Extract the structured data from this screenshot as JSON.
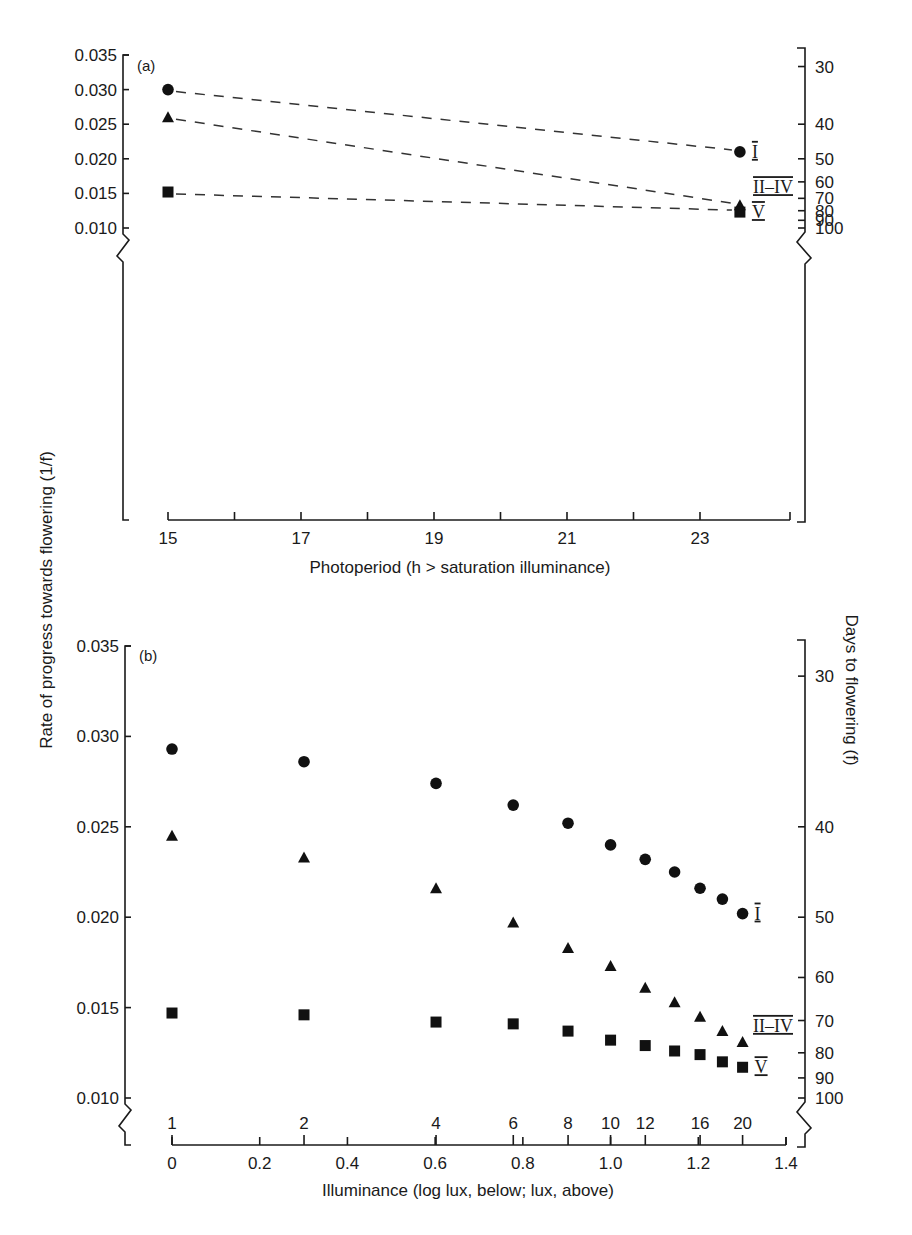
{
  "figure": {
    "shared_ylabel_left": "Rate of progress towards flowering (1/f)",
    "shared_ylabel_right": "Days to flowering (f)"
  },
  "chart_data": [
    {
      "panel": "(a)",
      "type": "line",
      "line_style": "dashed",
      "xlabel": "Photoperiod (h > saturation illuminance)",
      "ylabel": "Rate of progress towards flowering (1/f)",
      "ylabel_right": "Days to flowering (f)",
      "xlim": [
        15,
        23.8
      ],
      "ylim": [
        0.008,
        0.035
      ],
      "x_ticks": [
        15,
        16,
        17,
        18,
        19,
        20,
        21,
        22,
        23
      ],
      "x_tick_labels": [
        "15",
        "17",
        "19",
        "21",
        "23"
      ],
      "x_tick_label_values": [
        15,
        17,
        19,
        21,
        23
      ],
      "y_ticks": [
        0.01,
        0.015,
        0.02,
        0.025,
        0.03,
        0.035
      ],
      "y_tick_labels": [
        "0.010",
        "0.015",
        "0.020",
        "0.025",
        "0.030",
        "0.035"
      ],
      "right_axis_ticks_days": [
        30,
        40,
        50,
        60,
        70,
        80,
        90,
        100
      ],
      "right_axis_tick_labels": [
        "30",
        "40",
        "50",
        "60",
        "70",
        "80",
        "90",
        "100"
      ],
      "axis_break": true,
      "grid": false,
      "series": [
        {
          "name": "I",
          "marker": "circle",
          "x": [
            15,
            23.6
          ],
          "y": [
            0.03,
            0.021
          ]
        },
        {
          "name": "II–IV",
          "marker": "triangle",
          "x": [
            15,
            23.6
          ],
          "y": [
            0.026,
            0.0133
          ]
        },
        {
          "name": "V",
          "marker": "square",
          "x": [
            15,
            23.6
          ],
          "y": [
            0.0152,
            0.0123
          ]
        }
      ]
    },
    {
      "panel": "(b)",
      "type": "scatter",
      "xlabel": "Illuminance (log lux, below; lux, above)",
      "ylabel": "Rate of progress towards flowering (1/f)",
      "ylabel_right": "Days to flowering (f)",
      "xlim": [
        0,
        1.4
      ],
      "ylim": [
        0.008,
        0.035
      ],
      "x_ticks": [
        0,
        0.2,
        0.4,
        0.6,
        0.8,
        1.0,
        1.2,
        1.4
      ],
      "x_tick_labels": [
        "0",
        "0.2",
        "0.4",
        "0.6",
        "0.8",
        "1.0",
        "1.2",
        "1.4"
      ],
      "x_top_ticks_lux": [
        1,
        2,
        4,
        6,
        8,
        10,
        12,
        16,
        20
      ],
      "x_top_tick_labels": [
        "1",
        "2",
        "4",
        "6",
        "8",
        "10",
        "12",
        "16",
        "20"
      ],
      "y_ticks": [
        0.01,
        0.015,
        0.02,
        0.025,
        0.03,
        0.035
      ],
      "y_tick_labels": [
        "0.010",
        "0.015",
        "0.020",
        "0.025",
        "0.030",
        "0.035"
      ],
      "right_axis_ticks_days": [
        30,
        40,
        50,
        60,
        70,
        80,
        90,
        100
      ],
      "right_axis_tick_labels": [
        "30",
        "40",
        "50",
        "60",
        "70",
        "80",
        "90",
        "100"
      ],
      "axis_break": true,
      "grid": false,
      "series": [
        {
          "name": "I",
          "marker": "circle",
          "x": [
            0,
            0.301,
            0.602,
            0.778,
            0.903,
            1.0,
            1.079,
            1.146,
            1.204,
            1.255,
            1.301
          ],
          "y": [
            0.0293,
            0.0286,
            0.0274,
            0.0262,
            0.0252,
            0.024,
            0.0232,
            0.0225,
            0.0216,
            0.021,
            0.0202
          ]
        },
        {
          "name": "II–IV",
          "marker": "triangle",
          "x": [
            0,
            0.301,
            0.602,
            0.778,
            0.903,
            1.0,
            1.079,
            1.146,
            1.204,
            1.255,
            1.301
          ],
          "y": [
            0.0245,
            0.0233,
            0.0216,
            0.0197,
            0.0183,
            0.0173,
            0.0161,
            0.0153,
            0.0145,
            0.0137,
            0.0131
          ]
        },
        {
          "name": "V",
          "marker": "square",
          "x": [
            0,
            0.301,
            0.602,
            0.778,
            0.903,
            1.0,
            1.079,
            1.146,
            1.204,
            1.255,
            1.301
          ],
          "y": [
            0.0147,
            0.0146,
            0.0142,
            0.0141,
            0.0137,
            0.0132,
            0.0129,
            0.0126,
            0.0124,
            0.012,
            0.0117
          ]
        }
      ]
    }
  ]
}
